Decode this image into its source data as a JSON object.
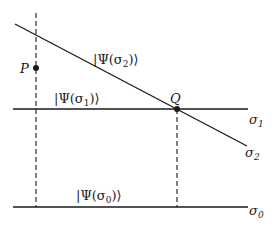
{
  "diagram": {
    "type": "geometric-state-diagram",
    "points": [
      {
        "name": "P",
        "label": "P"
      },
      {
        "name": "Q",
        "label": "Q"
      }
    ],
    "lines": [
      {
        "id": "sigma2",
        "label_base": "σ",
        "label_sub": "2",
        "state_label": "|Ψ(σ",
        "state_sub": "2",
        "state_close": ")⟩"
      },
      {
        "id": "sigma1",
        "label_base": "σ",
        "label_sub": "1",
        "state_label": "|Ψ(σ",
        "state_sub": "1",
        "state_close": ")⟩"
      },
      {
        "id": "sigma0",
        "label_base": "σ",
        "label_sub": "0",
        "state_label": "|Ψ(σ",
        "state_sub": "0",
        "state_close": ")⟩"
      }
    ],
    "colors": {
      "stroke": "#1a1a1a",
      "background": "#ffffff"
    }
  }
}
